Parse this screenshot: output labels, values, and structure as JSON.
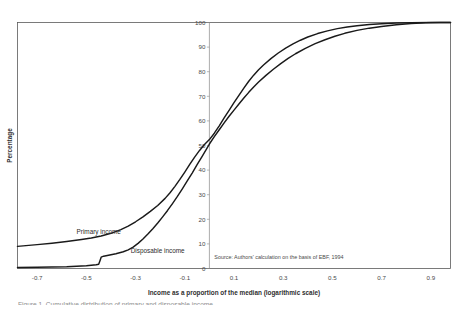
{
  "chart_data": {
    "type": "line",
    "title": "",
    "xlabel": "Income as a proportion of the median (logarithmic scale)",
    "ylabel": "Percentage",
    "xlim": [
      -0.78,
      0.98
    ],
    "ylim": [
      0,
      100
    ],
    "xticks": [
      "-0.7",
      "-0.5",
      "-0.3",
      "-0.1",
      "0.1",
      "0.3",
      "0.5",
      "0.7",
      "0.9"
    ],
    "xtick_values": [
      -0.7,
      -0.5,
      -0.3,
      -0.1,
      0.1,
      0.3,
      0.5,
      0.7,
      0.9
    ],
    "yticks": [
      "0",
      "10",
      "20",
      "30",
      "40",
      "50",
      "60",
      "70",
      "80",
      "90",
      "100"
    ],
    "ytick_values": [
      0,
      10,
      20,
      30,
      40,
      50,
      60,
      70,
      80,
      90,
      100
    ],
    "grid": false,
    "legend_position": "inline-annotations",
    "annotations": [
      {
        "name": "primary-income-label",
        "text": "Primary income",
        "x": -0.54,
        "y": 14
      },
      {
        "name": "disposable-income-label",
        "text": "Disposable income",
        "x": -0.32,
        "y": 6.5
      },
      {
        "name": "source-note",
        "text": "Source: Authors' calculation on the basis of EBF, 1994",
        "x": 0.02,
        "y": 4
      }
    ],
    "series": [
      {
        "name": "Primary income",
        "color": "#1a1a1a",
        "points": [
          [
            -0.78,
            9.0
          ],
          [
            -0.7,
            9.7
          ],
          [
            -0.64,
            10.3
          ],
          [
            -0.58,
            11.0
          ],
          [
            -0.52,
            11.8
          ],
          [
            -0.48,
            12.4
          ],
          [
            -0.44,
            13.2
          ],
          [
            -0.4,
            14.3
          ],
          [
            -0.36,
            15.8
          ],
          [
            -0.33,
            17.2
          ],
          [
            -0.3,
            19.0
          ],
          [
            -0.27,
            21.0
          ],
          [
            -0.24,
            23.2
          ],
          [
            -0.21,
            25.6
          ],
          [
            -0.18,
            28.5
          ],
          [
            -0.16,
            30.8
          ],
          [
            -0.14,
            33.4
          ],
          [
            -0.12,
            36.2
          ],
          [
            -0.1,
            39.2
          ],
          [
            -0.08,
            42.3
          ],
          [
            -0.06,
            45.3
          ],
          [
            -0.04,
            48.0
          ],
          [
            -0.02,
            50.4
          ],
          [
            0.0,
            52.4
          ],
          [
            0.02,
            55.0
          ],
          [
            0.04,
            58.0
          ],
          [
            0.06,
            61.2
          ],
          [
            0.08,
            64.3
          ],
          [
            0.1,
            67.4
          ],
          [
            0.12,
            70.4
          ],
          [
            0.14,
            73.3
          ],
          [
            0.16,
            76.1
          ],
          [
            0.18,
            78.6
          ],
          [
            0.2,
            80.8
          ],
          [
            0.22,
            82.7
          ],
          [
            0.25,
            85.3
          ],
          [
            0.28,
            87.6
          ],
          [
            0.31,
            89.6
          ],
          [
            0.34,
            91.3
          ],
          [
            0.37,
            92.8
          ],
          [
            0.4,
            94.1
          ],
          [
            0.44,
            95.5
          ],
          [
            0.48,
            96.6
          ],
          [
            0.52,
            97.5
          ],
          [
            0.56,
            98.2
          ],
          [
            0.6,
            98.7
          ],
          [
            0.65,
            99.2
          ],
          [
            0.7,
            99.5
          ],
          [
            0.76,
            99.8
          ],
          [
            0.82,
            99.9
          ],
          [
            0.9,
            100.0
          ],
          [
            0.98,
            100.0
          ]
        ]
      },
      {
        "name": "Disposable income",
        "color": "#1a1a1a",
        "points": [
          [
            -0.78,
            0.4
          ],
          [
            -0.7,
            0.5
          ],
          [
            -0.64,
            0.6
          ],
          [
            -0.58,
            0.7
          ],
          [
            -0.54,
            0.9
          ],
          [
            -0.5,
            1.1
          ],
          [
            -0.48,
            1.3
          ],
          [
            -0.46,
            1.5
          ],
          [
            -0.45,
            1.7
          ],
          [
            -0.444,
            3.4
          ],
          [
            -0.44,
            4.6
          ],
          [
            -0.43,
            5.0
          ],
          [
            -0.41,
            5.4
          ],
          [
            -0.38,
            6.0
          ],
          [
            -0.35,
            6.8
          ],
          [
            -0.33,
            7.6
          ],
          [
            -0.31,
            8.7
          ],
          [
            -0.29,
            10.2
          ],
          [
            -0.27,
            12.0
          ],
          [
            -0.25,
            14.0
          ],
          [
            -0.23,
            16.2
          ],
          [
            -0.21,
            18.5
          ],
          [
            -0.19,
            21.0
          ],
          [
            -0.17,
            23.6
          ],
          [
            -0.15,
            26.4
          ],
          [
            -0.13,
            29.3
          ],
          [
            -0.11,
            32.4
          ],
          [
            -0.09,
            35.6
          ],
          [
            -0.07,
            38.8
          ],
          [
            -0.05,
            42.2
          ],
          [
            -0.03,
            45.5
          ],
          [
            -0.015,
            48.0
          ],
          [
            0.0,
            50.6
          ],
          [
            0.02,
            53.6
          ],
          [
            0.04,
            56.4
          ],
          [
            0.06,
            59.2
          ],
          [
            0.08,
            61.9
          ],
          [
            0.1,
            64.4
          ],
          [
            0.12,
            66.9
          ],
          [
            0.14,
            69.3
          ],
          [
            0.16,
            71.6
          ],
          [
            0.18,
            73.8
          ],
          [
            0.2,
            75.8
          ],
          [
            0.23,
            78.5
          ],
          [
            0.26,
            81.0
          ],
          [
            0.29,
            83.3
          ],
          [
            0.32,
            85.4
          ],
          [
            0.35,
            87.3
          ],
          [
            0.39,
            89.5
          ],
          [
            0.43,
            91.4
          ],
          [
            0.47,
            93.0
          ],
          [
            0.51,
            94.4
          ],
          [
            0.55,
            95.6
          ],
          [
            0.6,
            96.8
          ],
          [
            0.65,
            97.7
          ],
          [
            0.7,
            98.4
          ],
          [
            0.76,
            99.1
          ],
          [
            0.82,
            99.6
          ],
          [
            0.88,
            99.9
          ],
          [
            0.94,
            100.0
          ],
          [
            0.98,
            100.0
          ]
        ]
      }
    ]
  },
  "caption": {
    "cut_off_text": "Figure 1.   Cumulative distribution of primary and disposable income"
  }
}
